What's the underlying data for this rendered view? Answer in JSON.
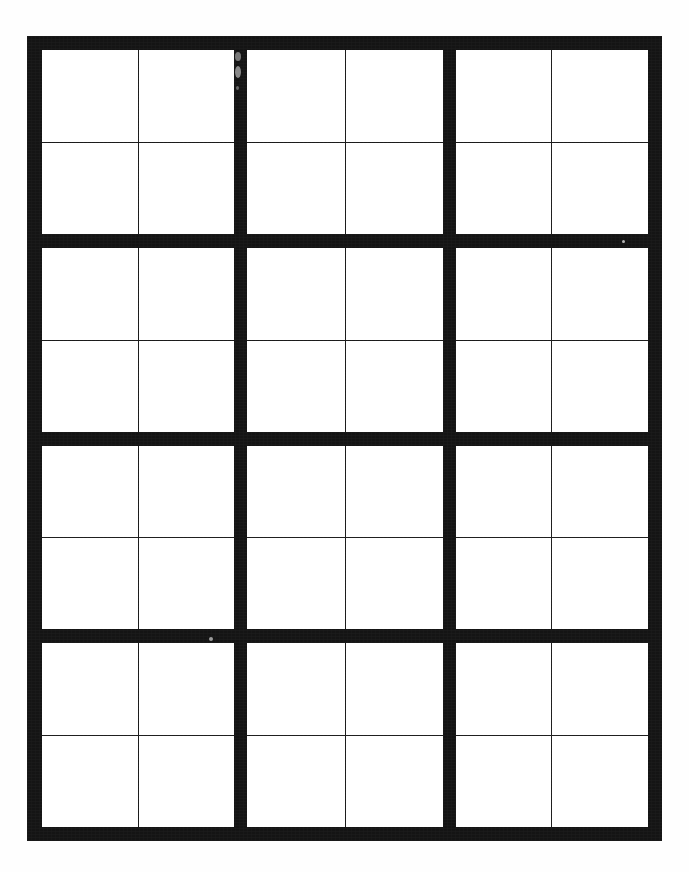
{
  "document": {
    "type": "scanned-blank-grid-worksheet",
    "page_background": "#ffffff",
    "ink_color": "#141414",
    "cell_fill": "#ffffff",
    "thin_rule_color": "#1b1b1b"
  },
  "header": {
    "text": "",
    "note": "faint text clipped at top edge of scan, illegible"
  },
  "footer": {
    "text": "",
    "note": "faint text clipped at bottom edge of scan, illegible"
  },
  "grid": {
    "block_columns": 3,
    "block_rows": 4,
    "cells_per_block_across": 2,
    "cells_per_block_down": 2,
    "total_columns": 6,
    "total_rows": 8,
    "total_cells": 48,
    "blocks": [
      {
        "id": "block-r1c1",
        "cells": [
          "",
          "",
          "",
          ""
        ]
      },
      {
        "id": "block-r1c2",
        "cells": [
          "",
          "",
          "",
          ""
        ]
      },
      {
        "id": "block-r1c3",
        "cells": [
          "",
          "",
          "",
          ""
        ]
      },
      {
        "id": "block-r2c1",
        "cells": [
          "",
          "",
          "",
          ""
        ]
      },
      {
        "id": "block-r2c2",
        "cells": [
          "",
          "",
          "",
          ""
        ]
      },
      {
        "id": "block-r2c3",
        "cells": [
          "",
          "",
          "",
          ""
        ]
      },
      {
        "id": "block-r3c1",
        "cells": [
          "",
          "",
          "",
          ""
        ]
      },
      {
        "id": "block-r3c2",
        "cells": [
          "",
          "",
          "",
          ""
        ]
      },
      {
        "id": "block-r3c3",
        "cells": [
          "",
          "",
          "",
          ""
        ]
      },
      {
        "id": "block-r4c1",
        "cells": [
          "",
          "",
          "",
          ""
        ]
      },
      {
        "id": "block-r4c2",
        "cells": [
          "",
          "",
          "",
          ""
        ]
      },
      {
        "id": "block-r4c3",
        "cells": [
          "",
          "",
          "",
          ""
        ]
      }
    ]
  },
  "artifacts": [
    {
      "id": "speck-a",
      "kind": "scan-speck"
    },
    {
      "id": "speck-b",
      "kind": "scan-speck"
    },
    {
      "id": "speck-c",
      "kind": "scan-speck"
    },
    {
      "id": "speck-d",
      "kind": "scan-speck"
    },
    {
      "id": "speck-e",
      "kind": "scan-speck"
    }
  ]
}
